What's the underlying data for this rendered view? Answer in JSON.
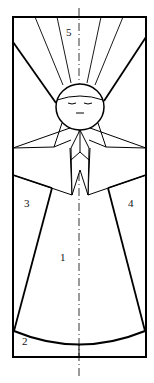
{
  "diagram": {
    "stroke_color": "#000000",
    "background": "#ffffff",
    "labels": [
      {
        "id": "1",
        "text": "1",
        "x": 60,
        "y": 258
      },
      {
        "id": "2",
        "text": "2",
        "x": 22,
        "y": 342
      },
      {
        "id": "3",
        "text": "3",
        "x": 24,
        "y": 204
      },
      {
        "id": "4",
        "text": "4",
        "x": 128,
        "y": 204
      },
      {
        "id": "5",
        "text": "5",
        "x": 66,
        "y": 30
      }
    ]
  }
}
